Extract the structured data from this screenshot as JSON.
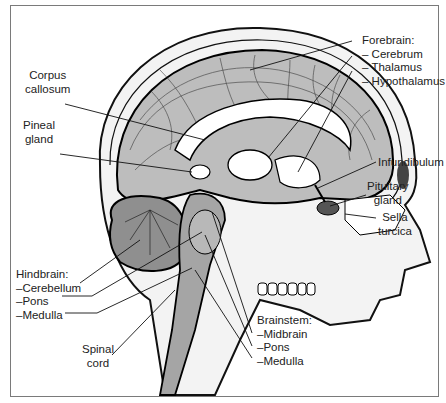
{
  "figure": {
    "labels": {
      "forebrain": {
        "title": "Forebrain:",
        "items": [
          "– Cerebrum",
          "– Thalamus",
          "– Hypothalamus"
        ]
      },
      "corpus_callosum": [
        "Corpus",
        "callosum"
      ],
      "pineal_gland": [
        "Pineal",
        "gland"
      ],
      "infundibulum": "Infundibulum",
      "pituitary_gland": [
        "Pituitary",
        "gland"
      ],
      "sella_turcica": [
        "Sella",
        "turcica"
      ],
      "hindbrain": {
        "title": "Hindbrain:",
        "items": [
          "–Cerebellum",
          "–Pons",
          "–Medulla"
        ]
      },
      "spinal_cord": [
        "Spinal",
        "cord"
      ],
      "brainstem": {
        "title": "Brainstem:",
        "items": [
          "–Midbrain",
          "–Pons",
          "–Medulla"
        ]
      }
    }
  }
}
